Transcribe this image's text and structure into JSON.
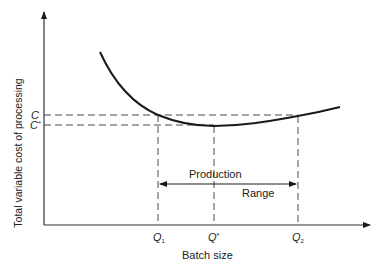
{
  "diagram": {
    "title": "",
    "y_axis_label": "Total variable cost of processing",
    "x_axis_label": "Batch size",
    "y_ticks": [
      {
        "label": "C",
        "superscript": ""
      },
      {
        "label": "C",
        "superscript": "*"
      }
    ],
    "x_ticks": [
      {
        "label": "Q",
        "subscript": "1"
      },
      {
        "label": "Q",
        "superscript": "*"
      },
      {
        "label": "Q",
        "subscript": "2"
      }
    ],
    "range_annotation": {
      "top_label": "Production",
      "bottom_label": "Range"
    },
    "colors": {
      "line": "#1a1a1a",
      "text": "#222222",
      "background": "#ffffff"
    }
  }
}
